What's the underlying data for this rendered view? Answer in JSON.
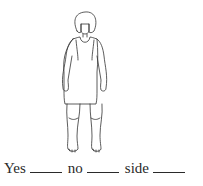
{
  "illustration": {
    "subject": "standing-girl-in-sleeveless-dress",
    "line_color": "#333333"
  },
  "answer_line": {
    "options": [
      {
        "label": "Yes",
        "value": ""
      },
      {
        "label": "no",
        "value": ""
      },
      {
        "label": "side",
        "value": ""
      }
    ]
  }
}
